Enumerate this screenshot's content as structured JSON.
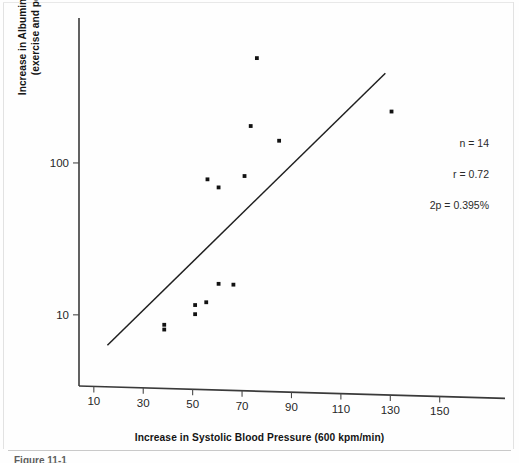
{
  "figure": {
    "caption": "Figure 11-1",
    "x_axis_title": "Increase in Systolic Blood Pressure (600 kpm/min)",
    "y_axis_title_line1": "Increase in Albumin Excretion Rate (µg/min)",
    "y_axis_title_line2": "(exercise and postexercise periods)",
    "stats": {
      "n": "n = 14",
      "r": "r = 0.72",
      "p": "2p = 0.395%"
    }
  },
  "chart_data": {
    "type": "scatter",
    "title": "",
    "xlabel": "Increase in Systolic Blood Pressure (600 kpm/min)",
    "ylabel": "Increase in Albumin Excretion Rate (µg/min) (exercise and postexercise periods)",
    "xscale": "linear",
    "yscale": "log",
    "xlim": [
      4,
      157
    ],
    "ylim": [
      3.4,
      900
    ],
    "grid": false,
    "legend": false,
    "xticks": [
      10,
      30,
      50,
      70,
      90,
      110,
      130,
      150
    ],
    "xtick_labels": [
      "10",
      "30",
      "50",
      "70",
      "90",
      "110",
      "130",
      "150"
    ],
    "yticks": [
      10,
      100
    ],
    "ytick_labels": [
      "10",
      "100"
    ],
    "points": [
      {
        "x": 38.5,
        "y": 8.6
      },
      {
        "x": 38.5,
        "y": 8.0
      },
      {
        "x": 51.0,
        "y": 11.6
      },
      {
        "x": 51.0,
        "y": 10.1
      },
      {
        "x": 55.5,
        "y": 12.1
      },
      {
        "x": 60.5,
        "y": 16.0
      },
      {
        "x": 66.5,
        "y": 15.8
      },
      {
        "x": 56.0,
        "y": 78.0
      },
      {
        "x": 60.5,
        "y": 69.0
      },
      {
        "x": 71.0,
        "y": 82.0
      },
      {
        "x": 73.5,
        "y": 175.0
      },
      {
        "x": 76.0,
        "y": 490.0
      },
      {
        "x": 85.0,
        "y": 140.0
      },
      {
        "x": 130.5,
        "y": 218.0
      }
    ],
    "fit_line": {
      "label": "regression line",
      "x_start": 15.5,
      "y_start": 6.3,
      "x_end": 128.0,
      "y_end": 390.0
    },
    "annotations": [
      {
        "text": "n = 14"
      },
      {
        "text": "r = 0.72"
      },
      {
        "text": "2p = 0.395%"
      }
    ]
  }
}
